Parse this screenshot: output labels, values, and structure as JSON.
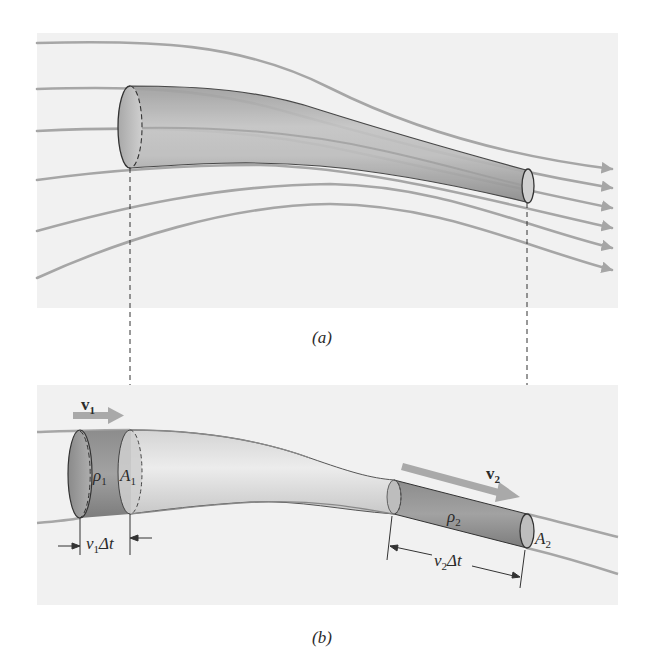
{
  "figure": {
    "panels": [
      {
        "id": "a",
        "caption": "(a)",
        "description": "Streamlines flowing through a narrowing flow tube",
        "streamline_count": 6
      },
      {
        "id": "b",
        "caption": "(b)",
        "description": "Fluid element moving through flow tube of varying cross-section"
      }
    ],
    "labels": {
      "v1": "v",
      "v1_sub": "1",
      "v2": "v",
      "v2_sub": "2",
      "rho1": "ρ",
      "rho1_sub": "1",
      "rho2": "ρ",
      "rho2_sub": "2",
      "A1": "A",
      "A1_sub": "1",
      "A2": "A",
      "A2_sub": "2",
      "v1dt_v": "v",
      "v1dt_sub": "1",
      "v1dt_rest": "Δt",
      "v2dt_v": "v",
      "v2dt_sub": "2",
      "v2dt_rest": "Δt"
    },
    "colors": {
      "panel_bg": "#f1f1f1",
      "streamline": "#a6a6a6",
      "tube_fill": "#b9b9b9",
      "tube_light": "#e2e2e2",
      "fluid_dark": "#8f8f8f",
      "outline": "#333333",
      "arrow": "#a9a9a9"
    }
  }
}
